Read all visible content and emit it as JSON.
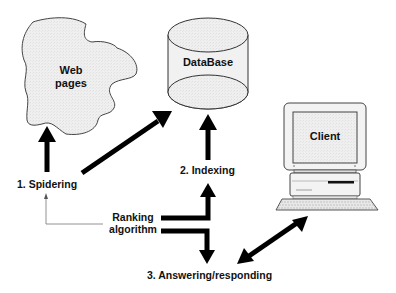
{
  "diagram": {
    "nodes": {
      "web_pages": {
        "label_line1": "Web",
        "label_line2": "pages",
        "shape": "cloud"
      },
      "database": {
        "label": "DataBase",
        "shape": "cylinder"
      },
      "client": {
        "label": "Client",
        "shape": "computer"
      }
    },
    "steps": {
      "spidering": "1. Spidering",
      "indexing": "2. Indexing",
      "answering": "3. Answering/responding"
    },
    "ranking": {
      "line1": "Ranking",
      "line2": "algorithm"
    },
    "edges": [
      {
        "from": "spidering",
        "to": "web_pages",
        "style": "thick"
      },
      {
        "from": "spidering",
        "to": "database",
        "style": "thick"
      },
      {
        "from": "indexing",
        "to": "database",
        "style": "thick"
      },
      {
        "from": "ranking",
        "to": "indexing",
        "style": "thick"
      },
      {
        "from": "ranking",
        "to": "answering",
        "style": "thick"
      },
      {
        "from": "ranking",
        "to": "spidering",
        "style": "thin"
      },
      {
        "from": "answering",
        "to": "client",
        "style": "thick-bidirectional"
      }
    ],
    "colors": {
      "fill": "#eeeeee",
      "stroke": "#333333",
      "arrow": "#000000",
      "thin_line": "#666666"
    }
  }
}
